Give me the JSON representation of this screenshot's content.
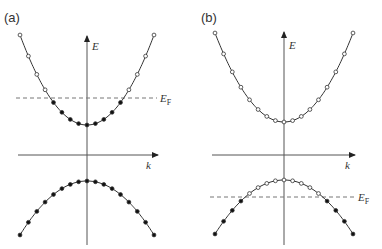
{
  "figure": {
    "panels": [
      {
        "id": "a",
        "label": "(a)",
        "axis_x": 87,
        "axis_y": 155,
        "y_label": "E",
        "x_label": "k",
        "fermi_label": "E",
        "fermi_sub": "F",
        "fermi_y": 98,
        "fermi_x1": 16,
        "fermi_x2": 157,
        "conduction_band": {
          "vertex_y": 125,
          "end_y": 35,
          "half_width": 67,
          "filled_below_fermi": true
        },
        "valence_band": {
          "vertex_y": 181,
          "end_y": 235,
          "half_width": 67,
          "all_filled": true
        },
        "description": "Fermi level in conduction band (metal/n-type)"
      },
      {
        "id": "b",
        "label": "(b)",
        "axis_x": 284,
        "axis_y": 155,
        "y_label": "E",
        "x_label": "k",
        "fermi_label": "E",
        "fermi_sub": "F",
        "fermi_y": 197,
        "fermi_x1": 210,
        "fermi_x2": 355,
        "conduction_band": {
          "vertex_y": 122,
          "end_y": 33,
          "half_width": 69,
          "all_empty": true
        },
        "valence_band": {
          "vertex_y": 180,
          "end_y": 234,
          "half_width": 69,
          "filled_below_fermi": true
        },
        "description": "Fermi level in valence band (p-type)"
      }
    ],
    "colors": {
      "line": "#333333",
      "axis": "#555555",
      "dash": "#777777",
      "fill": "#111111",
      "open": "#ffffff"
    }
  }
}
